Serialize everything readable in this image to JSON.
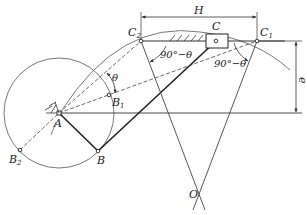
{
  "diagram": {
    "type": "offset slider-crank mechanism (extreme positions, crank angle of repeat)",
    "points": {
      "A": {
        "label": "A",
        "x": 59,
        "y": 113
      },
      "B": {
        "label": "B",
        "x": 98,
        "y": 151
      },
      "B1": {
        "label": "B",
        "sub": "1",
        "x": 109,
        "y": 95
      },
      "B2": {
        "label": "B",
        "sub": "2",
        "x": 20,
        "y": 150
      },
      "C": {
        "label": "C",
        "x": 216,
        "y": 41
      },
      "C1": {
        "label": "C",
        "sub": "1",
        "x": 257,
        "y": 41
      },
      "C2": {
        "label": "C",
        "sub": "2",
        "x": 141,
        "y": 41
      },
      "O": {
        "label": "O",
        "x": 198,
        "y": 195
      }
    },
    "dimensions": {
      "stroke": {
        "label": "H"
      },
      "offset": {
        "label": "e"
      }
    },
    "angles": {
      "theta": "θ",
      "left": "90°−θ",
      "right": "90°−θ"
    },
    "colors": {
      "line": "#333333",
      "background": "#ffffff"
    }
  }
}
